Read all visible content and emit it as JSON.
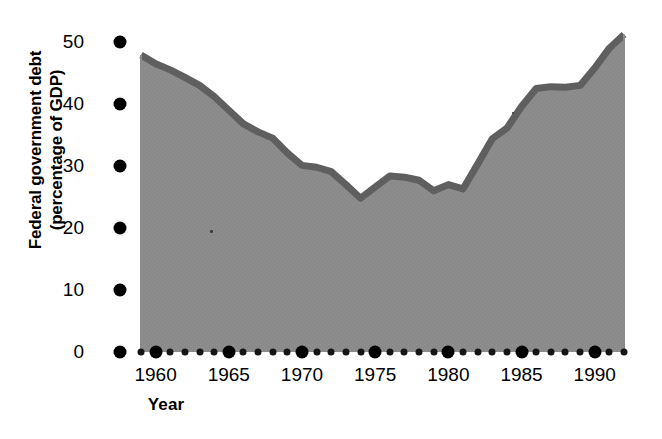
{
  "chart_data": {
    "type": "area",
    "title": "",
    "xlabel": "Year",
    "ylabel": "Federal government debt (percentage of GDP)",
    "ylabel_line1": "Federal government debt",
    "ylabel_line2": "(percentage of GDP)",
    "xlim": [
      1959,
      1992
    ],
    "ylim": [
      0,
      52
    ],
    "ytick_labels": [
      "0",
      "10",
      "20",
      "30",
      "40",
      "50"
    ],
    "ytick_values": [
      0,
      10,
      20,
      30,
      40,
      50
    ],
    "xtick_labels": [
      "1960",
      "1965",
      "1970",
      "1975",
      "1980",
      "1985",
      "1990"
    ],
    "xtick_values": [
      1960,
      1965,
      1970,
      1975,
      1980,
      1985,
      1990
    ],
    "minor_xticks": [
      1959,
      1961,
      1962,
      1963,
      1964,
      1966,
      1967,
      1968,
      1969,
      1971,
      1972,
      1973,
      1974,
      1976,
      1977,
      1978,
      1979,
      1981,
      1982,
      1983,
      1984,
      1986,
      1987,
      1988,
      1989,
      1991,
      1992
    ],
    "grid": false,
    "legend": "none",
    "fill_color": "#8a8a8a",
    "line_color": "#5f5f5f",
    "axis_color": "#000000",
    "x": [
      1959,
      1960,
      1961,
      1962,
      1963,
      1964,
      1965,
      1966,
      1967,
      1968,
      1969,
      1970,
      1971,
      1972,
      1973,
      1974,
      1975,
      1976,
      1977,
      1978,
      1979,
      1980,
      1981,
      1982,
      1983,
      1984,
      1985,
      1986,
      1987,
      1988,
      1989,
      1990,
      1991,
      1992
    ],
    "values": [
      47.9,
      46.5,
      45.5,
      44.3,
      43.0,
      41.2,
      39.0,
      36.8,
      35.5,
      34.5,
      32.1,
      30.1,
      29.8,
      29.1,
      27.0,
      24.8,
      26.6,
      28.4,
      28.2,
      27.7,
      26.0,
      27.0,
      26.3,
      30.3,
      34.4,
      36.1,
      39.6,
      42.5,
      42.8,
      42.7,
      43.0,
      45.8,
      49.0,
      51.2
    ],
    "series": [
      {
        "name": "Federal government debt (percentage of GDP)",
        "values": [
          47.9,
          46.5,
          45.5,
          44.3,
          43.0,
          41.2,
          39.0,
          36.8,
          35.5,
          34.5,
          32.1,
          30.1,
          29.8,
          29.1,
          27.0,
          24.8,
          26.6,
          28.4,
          28.2,
          27.7,
          26.0,
          27.0,
          26.3,
          30.3,
          34.4,
          36.1,
          39.6,
          42.5,
          42.8,
          42.7,
          43.0,
          45.8,
          49.0,
          51.2
        ]
      }
    ]
  }
}
